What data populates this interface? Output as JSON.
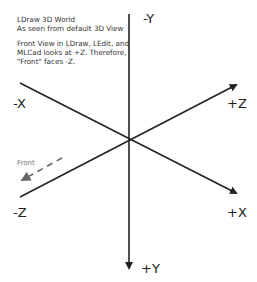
{
  "notes": {
    "title_line1": "LDraw 3D World",
    "title_line2": "As seen from default 3D View",
    "body_line1": "Front View in LDraw, LEdit, and",
    "body_line2": "MLCad looks at +Z. Therefore,",
    "body_line3": "\"Front\" faces -Z."
  },
  "axes": {
    "neg_y": "-Y",
    "pos_y": "+Y",
    "neg_x": "-X",
    "pos_x": "+X",
    "neg_z": "-Z",
    "pos_z": "+Z"
  },
  "front": {
    "label": "Front"
  },
  "colors": {
    "axis": "#222222",
    "front_arrow": "#666666",
    "text": "#333333"
  }
}
